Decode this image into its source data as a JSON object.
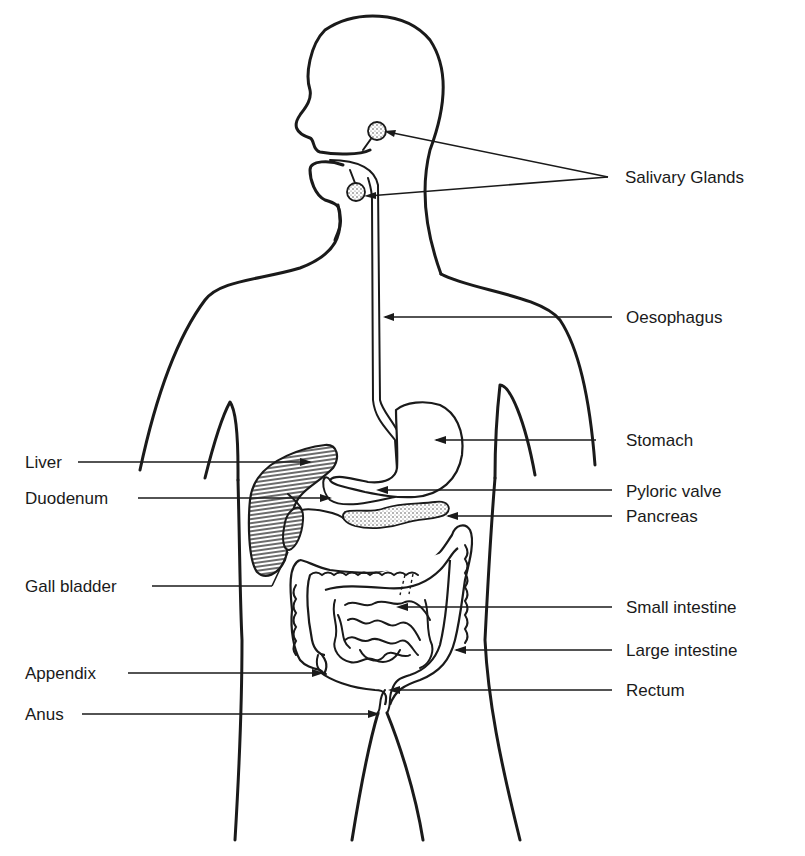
{
  "diagram": {
    "colors": {
      "ink": "#1a1a1a",
      "background": "#ffffff"
    },
    "labels_right": {
      "salivary_glands": "Salivary Glands",
      "oesophagus": "Oesophagus",
      "stomach": "Stomach",
      "pyloric_valve": "Pyloric valve",
      "pancreas": "Pancreas",
      "small_intestine": "Small intestine",
      "large_intestine": "Large intestine",
      "rectum": "Rectum"
    },
    "labels_left": {
      "liver": "Liver",
      "duodenum": "Duodenum",
      "gall_bladder": "Gall bladder",
      "appendix": "Appendix",
      "anus": "Anus"
    }
  }
}
